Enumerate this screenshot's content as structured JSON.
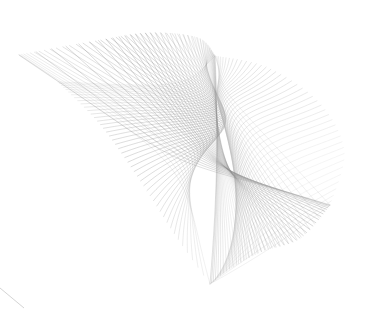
{
  "canvas": {
    "width": 372,
    "height": 313,
    "background_color": "#ffffff",
    "title": "Generative Line Art Envelope"
  },
  "artwork": {
    "name": "swept-line-family-envelope",
    "description": "Dense family of smoothly swept curves forming a folded caustic envelope surface",
    "stroke_color_light": "#d8d8d8",
    "stroke_color_mid": "#a8a8a8",
    "stroke_color_dark": "#6e6e6e",
    "stroke_width": 0.45,
    "curve_count": 130
  },
  "chart_data": {
    "type": "line",
    "xlabel": "",
    "ylabel": "",
    "xlim": [
      0,
      372
    ],
    "ylim": [
      0,
      313
    ],
    "grid": false,
    "legend": "none",
    "parametric": {
      "family_size": 130,
      "t_start": 0,
      "t_end": 1,
      "anchor_points": [
        {
          "name": "left-cusp",
          "x": 19,
          "y": 55
        },
        {
          "name": "top-fold",
          "x": 152,
          "y": 33
        },
        {
          "name": "top-right-fold",
          "x": 205,
          "y": 40
        },
        {
          "name": "right-lobe-peak",
          "x": 344,
          "y": 150
        },
        {
          "name": "bottom-cusp",
          "x": 210,
          "y": 284
        },
        {
          "name": "lower-right-tail",
          "x": 330,
          "y": 232
        },
        {
          "name": "inner-hole-center",
          "x": 172,
          "y": 208
        }
      ],
      "control_rails": {
        "rail_a": [
          {
            "x": 19,
            "y": 55
          },
          {
            "x": 96,
            "y": 41
          },
          {
            "x": 150,
            "y": 33
          },
          {
            "x": 198,
            "y": 38
          },
          {
            "x": 215,
            "y": 56
          }
        ],
        "rail_b": [
          {
            "x": 215,
            "y": 56
          },
          {
            "x": 268,
            "y": 68
          },
          {
            "x": 320,
            "y": 104
          },
          {
            "x": 344,
            "y": 152
          },
          {
            "x": 330,
            "y": 205
          }
        ],
        "rail_c": [
          {
            "x": 330,
            "y": 205
          },
          {
            "x": 300,
            "y": 238
          },
          {
            "x": 260,
            "y": 252
          },
          {
            "x": 228,
            "y": 270
          },
          {
            "x": 210,
            "y": 284
          }
        ],
        "rail_d": [
          {
            "x": 210,
            "y": 284
          },
          {
            "x": 176,
            "y": 236
          },
          {
            "x": 140,
            "y": 180
          },
          {
            "x": 100,
            "y": 124
          },
          {
            "x": 58,
            "y": 82
          }
        ]
      }
    },
    "series": [
      {
        "name": "family-a-upper-sweep",
        "stroke": "#9a9a9a",
        "count": 46
      },
      {
        "name": "family-b-right-lobe",
        "stroke": "#b5b5b5",
        "count": 44
      },
      {
        "name": "family-c-lower-mesh",
        "stroke": "#8f8f8f",
        "count": 40
      }
    ]
  },
  "artifacts": [
    {
      "name": "corner-scratch-bottom-left",
      "x1": 0,
      "y1": 288,
      "x2": 24,
      "y2": 308,
      "color": "#cfcfcf"
    }
  ]
}
